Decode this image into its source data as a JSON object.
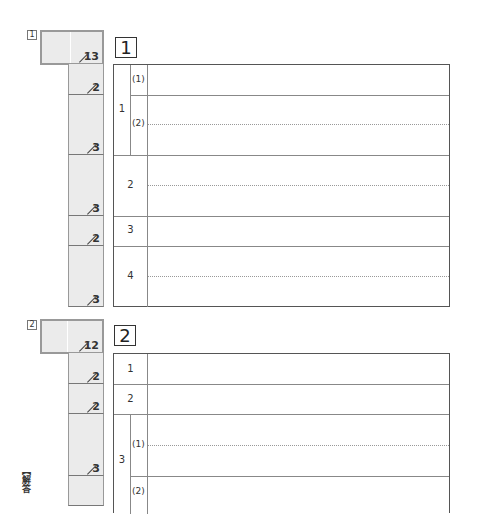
{
  "page": {
    "type": "answer-sheet",
    "colors": {
      "score_fill": "#ebebeb",
      "border": "#888888",
      "text": "#333333"
    }
  },
  "sections": [
    {
      "index_label": "1",
      "heading": "1",
      "total_points": "13",
      "rows": [
        {
          "q": "1",
          "sub": "(1)",
          "points": "2"
        },
        {
          "q": "",
          "sub": "(2)",
          "points": "3"
        },
        {
          "q": "2",
          "sub": "",
          "points": "3"
        },
        {
          "q": "3",
          "sub": "",
          "points": "2"
        },
        {
          "q": "4",
          "sub": "",
          "points": "3"
        }
      ]
    },
    {
      "index_label": "2",
      "heading": "2",
      "total_points": "12",
      "rows": [
        {
          "q": "1",
          "sub": "",
          "points": "2"
        },
        {
          "q": "2",
          "sub": "",
          "points": "2"
        },
        {
          "q": "3",
          "sub": "(1)",
          "points": "3"
        },
        {
          "q": "",
          "sub": "(2)",
          "points": ""
        }
      ]
    }
  ],
  "side_note": "【解答"
}
